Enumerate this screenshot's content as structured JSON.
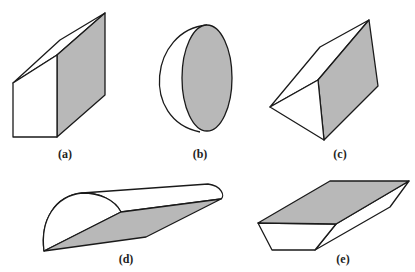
{
  "figure": {
    "shade_color": "#b8b8b8",
    "line_color": "#1a1a1a",
    "fill_white": "#ffffff",
    "shapes": [
      {
        "id": "a",
        "label": "(a)",
        "description": "prism with pentagonal cross-section, shaded side face"
      },
      {
        "id": "b",
        "label": "(b)",
        "description": "half-ellipsoid with shaded elliptical cut face"
      },
      {
        "id": "c",
        "label": "(c)",
        "description": "triangular prism with shaded rectangular face"
      },
      {
        "id": "d",
        "label": "(d)",
        "description": "half-cylinder with shaded diagonal cut plane"
      },
      {
        "id": "e",
        "label": "(e)",
        "description": "trapezoidal prism with shaded top face"
      }
    ]
  }
}
